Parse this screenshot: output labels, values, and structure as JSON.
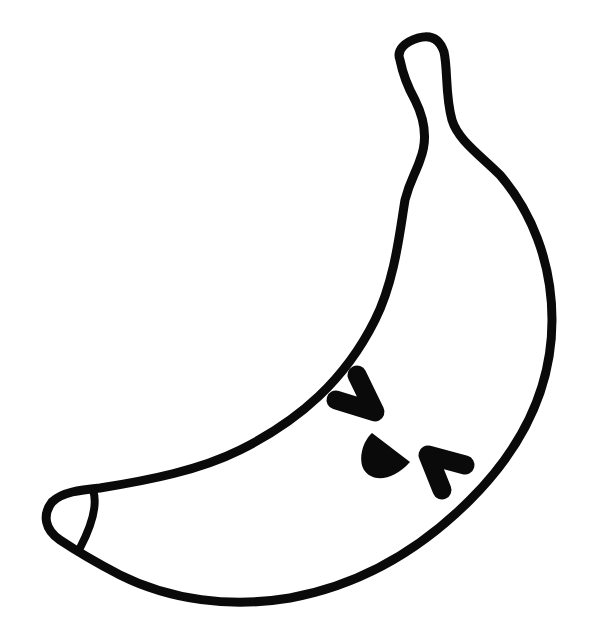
{
  "image": {
    "subject": "Cute banana with a face",
    "style": "black line art on white",
    "colors": {
      "background": "#ffffff",
      "stroke": "#0a0a0a",
      "fill": "#ffffff"
    },
    "parts": [
      {
        "name": "banana-body",
        "description": "crescent-shaped outline"
      },
      {
        "name": "banana-stem",
        "description": "curved stem at top right"
      },
      {
        "name": "banana-tip",
        "description": "bottom-left tip with a curved line"
      },
      {
        "name": "left-eye",
        "description": "squinting chevron '>'"
      },
      {
        "name": "right-eye",
        "description": "squinting chevron '<'"
      },
      {
        "name": "mouth",
        "description": "half-circle open mouth"
      }
    ],
    "expression": ">◡<"
  }
}
